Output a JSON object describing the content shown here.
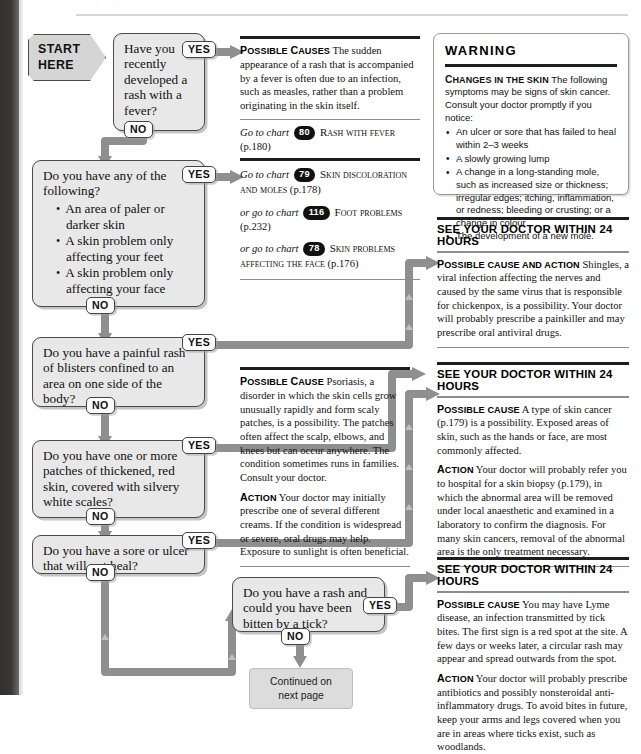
{
  "page": {
    "ghost_text": "·                    ·                    ·                    ·        ◌                    ·"
  },
  "start": {
    "line1": "START",
    "line2": "HERE"
  },
  "labels": {
    "yes": "YES",
    "no": "NO"
  },
  "questions": [
    {
      "id": "q1",
      "text": "Have you recently developed a rash with a fever?"
    },
    {
      "id": "q2",
      "text": "Do you have any of the following?",
      "bullets": [
        "An area of paler or darker skin",
        "A skin problem only affecting your feet",
        "A skin problem only affecting your face"
      ]
    },
    {
      "id": "q3",
      "text": "Do you have a painful rash of blisters confined to an area on one side of the body?"
    },
    {
      "id": "q4",
      "text": "Do you have one or more patches of thickened, red skin, covered with silvery white scales?"
    },
    {
      "id": "q5",
      "text": "Do you have a sore or ulcer that will not heal?"
    },
    {
      "id": "q6",
      "text": "Do you have a rash and could you have been bitten by a tick?"
    }
  ],
  "continued": {
    "line1": "Continued on",
    "line2": "next page"
  },
  "advice": {
    "a1": {
      "lead": "Possible causes",
      "body": "The sudden appearance of a rash that is accompanied by a fever is often due to an infection, such as measles, rather than a problem originating in the skin itself.",
      "referral": {
        "prefix": "Go to chart",
        "number": "80",
        "title": "Rash with fever",
        "page": "(p.180)"
      }
    },
    "a2": {
      "referrals": [
        {
          "prefix": "Go to chart",
          "number": "79",
          "title": "Skin discoloration and moles",
          "page": "(p.178)"
        },
        {
          "prefix": "or go to chart",
          "number": "116",
          "title": "Foot problems",
          "page": "(p.232)"
        },
        {
          "prefix": "or go to chart",
          "number": "78",
          "title": "Skin problems affecting the face",
          "page": "(p.176)"
        }
      ]
    },
    "a3": {
      "lead": "Possible cause",
      "body": "Psoriasis, a disorder in which the skin cells grow unusually rapidly and form scaly patches, is a possibility. The patches often affect the scalp, elbows, and knees but can occur anywhere. The condition sometimes runs in families. Consult your doctor.",
      "action_lead": "Action",
      "action_body": "Your doctor may initially prescribe one of several different creams. If the condition is widespread or severe, oral drugs may help. Exposure to sunlight is often beneficial."
    }
  },
  "panels": {
    "warning": {
      "title": "WARNING",
      "lead": "Changes in the skin",
      "body": "The following symptoms may be signs of skin cancer. Consult your doctor promptly if you notice:",
      "bullets": [
        "An ulcer or sore that has failed to heal within 2–3 weeks",
        "A slowly growing lump",
        "A change in a long-standing mole, such as increased size or thickness; irregular edges; itching, inflammation, or redness; bleeding or crusting; or a change in colour",
        "The development of a new mole."
      ]
    },
    "p1": {
      "heading": "SEE YOUR DOCTOR WITHIN 24 HOURS",
      "lead": "Possible cause and action",
      "body": "Shingles, a viral infection affecting the nerves and caused by the same virus that is responsible for chickenpox, is a possibility. Your doctor will probably prescribe a painkiller and may prescribe oral antiviral drugs."
    },
    "p2": {
      "heading": "SEE YOUR DOCTOR WITHIN 24 HOURS",
      "lead": "Possible cause",
      "body": "A type of skin cancer (p.179) is a possibility. Exposed areas of skin, such as the hands or face, are most commonly affected.",
      "action_lead": "Action",
      "action_body": "Your doctor will probably refer you to hospital for a skin biopsy (p.179), in which the abnormal area will be removed under local anaesthetic and examined in a laboratory to confirm the diagnosis. For many skin cancers, removal of the abnormal area is the only treatment necessary."
    },
    "p3": {
      "heading": "SEE YOUR DOCTOR WITHIN 24 HOURS",
      "lead": "Possible cause",
      "body": "You may have Lyme disease, an infection transmitted by tick bites. The first sign is a red spot at the site. A few days or weeks later, a circular rash may appear and spread outwards from the spot.",
      "action_lead": "Action",
      "action_body": "Your doctor will probably prescribe antibiotics and possibly nonsteroidal anti-inflammatory drugs. To avoid bites in future, keep your arms and legs covered when you are in areas where ticks exist, such as woodlands."
    }
  },
  "colors": {
    "connector": "#8f8f8f",
    "box_fill": "#e8e8e8",
    "rule_dark": "#1d1d1d"
  }
}
